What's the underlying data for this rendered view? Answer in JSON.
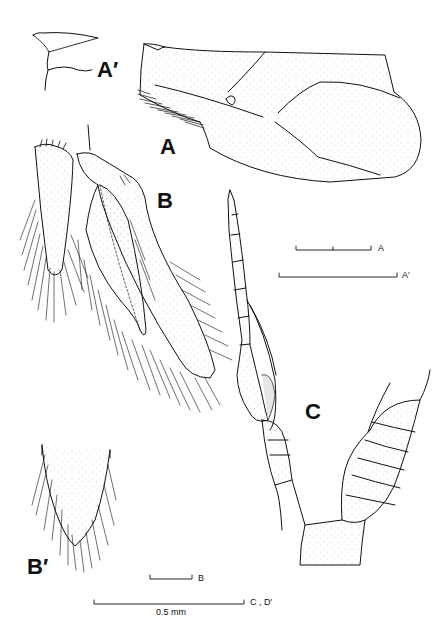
{
  "figure": {
    "panels": [
      {
        "id": "A_prime",
        "label": "A′",
        "description": "detail of anterior margin"
      },
      {
        "id": "A",
        "label": "A",
        "description": "carapace / plate, lateral view"
      },
      {
        "id": "B",
        "label": "B",
        "description": "telson and uropods"
      },
      {
        "id": "B_prime",
        "label": "B′",
        "description": "telson tip detail"
      },
      {
        "id": "C",
        "label": "C",
        "description": "antennule / appendage and segmented body"
      }
    ],
    "scale_bars": [
      {
        "label": "A",
        "x1": 296,
        "x2": 371,
        "y": 249,
        "tick_mid": true
      },
      {
        "label": "A′",
        "x1": 279,
        "x2": 397,
        "y": 276,
        "tick_mid": false
      },
      {
        "label": "B",
        "x1": 150,
        "x2": 192,
        "y": 579,
        "tick_mid": false
      },
      {
        "label": "C , D′",
        "x1": 94,
        "x2": 244,
        "y": 604,
        "tick_mid": false,
        "caption": "0.5 mm"
      }
    ]
  }
}
